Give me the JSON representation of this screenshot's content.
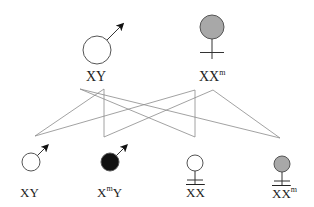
{
  "colors": {
    "stroke": "#555555",
    "line": "#8a8a8a",
    "carrier_fill": "#a8a8a8",
    "affected_fill": "#111111",
    "normal_fill": "#ffffff"
  },
  "parents": [
    {
      "sex": "male",
      "status": "normal",
      "genotype_base": "XY",
      "genotype_sup": "",
      "genotype_tail": "",
      "cx": 97,
      "cy": 50,
      "r": 14
    },
    {
      "sex": "female",
      "status": "carrier",
      "genotype_base": "XX",
      "genotype_sup": "m",
      "genotype_tail": "",
      "cx": 212,
      "cy": 27,
      "r": 12
    }
  ],
  "offspring": [
    {
      "sex": "male",
      "status": "normal",
      "genotype_base": "XY",
      "genotype_sup": "",
      "genotype_tail": "",
      "cx": 31,
      "cy": 162,
      "r": 9
    },
    {
      "sex": "male",
      "status": "affected",
      "genotype_base": "X",
      "genotype_sup": "m",
      "genotype_tail": "Y",
      "cx": 110,
      "cy": 162,
      "r": 9
    },
    {
      "sex": "female",
      "status": "normal",
      "genotype_base": "XX",
      "genotype_sup": "",
      "genotype_tail": "",
      "cx": 195,
      "cy": 163,
      "r": 8
    },
    {
      "sex": "female",
      "status": "carrier",
      "genotype_base": "XX",
      "genotype_sup": "m",
      "genotype_tail": "",
      "cx": 282,
      "cy": 164,
      "r": 8
    }
  ],
  "labels": {
    "parent_male": "XY",
    "parent_female": "XX",
    "parent_female_sup": "m",
    "child1": "XY",
    "child2_base": "X",
    "child2_sup": "m",
    "child2_tail": "Y",
    "child3": "XX",
    "child4": "XX",
    "child4_sup": "m"
  },
  "cross_lines": [
    [
      80,
      89,
      280,
      138
    ],
    [
      80,
      89,
      195,
      137
    ],
    [
      104,
      89,
      35,
      136
    ],
    [
      104,
      89,
      104,
      137
    ],
    [
      104,
      137,
      213,
      90
    ],
    [
      195,
      90,
      35,
      136
    ],
    [
      195,
      90,
      195,
      137
    ],
    [
      213,
      90,
      280,
      138
    ]
  ]
}
